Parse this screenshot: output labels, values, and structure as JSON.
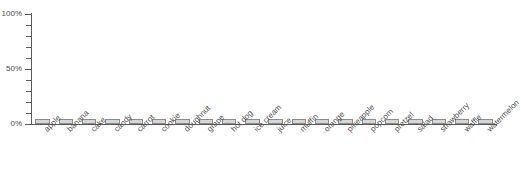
{
  "chart_data": {
    "type": "bar",
    "title": "",
    "subtitle": "",
    "xlabel": "",
    "ylabel": "",
    "categories": [
      "apple",
      "banana",
      "cake",
      "candy",
      "carrot",
      "cookie",
      "doughnut",
      "grape",
      "hot dog",
      "ice cream",
      "juice",
      "muffin",
      "orange",
      "pineapple",
      "popcorn",
      "pretzel",
      "salad",
      "strawberry",
      "waffle",
      "watermelon"
    ],
    "values": [
      5,
      5,
      5,
      5,
      5,
      5,
      5,
      5,
      5,
      5,
      5,
      5,
      5,
      5,
      5,
      5,
      5,
      5,
      5,
      5
    ],
    "ylim": [
      0,
      100
    ],
    "yticks": [
      0,
      10,
      20,
      30,
      40,
      50,
      60,
      70,
      80,
      90,
      100
    ],
    "ytick_labels": [
      "0%",
      "",
      "",
      "",
      "",
      "50%",
      "",
      "",
      "",
      "",
      "100%"
    ],
    "grid": false,
    "legend": false,
    "legend_position": "none",
    "annotations": [],
    "bar_fill_color": "#d6d6d6",
    "bar_border_color": "#8c8c8c",
    "axis_color": "#5a5a5a",
    "text_color": "#4d4d4d",
    "background_color": "#ffffff",
    "xtick_label_rotation": -45
  }
}
